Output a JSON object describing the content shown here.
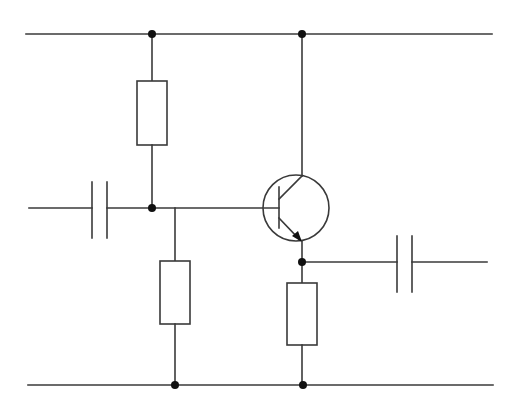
{
  "diagram": {
    "type": "circuit-schematic",
    "circuit": "NPN emitter-follower amplifier with voltage-divider bias",
    "components": [
      {
        "id": "R1",
        "kind": "resistor",
        "role": "upper bias resistor (top rail to base)"
      },
      {
        "id": "R2",
        "kind": "resistor",
        "role": "lower bias resistor (base to bottom rail)"
      },
      {
        "id": "R3",
        "kind": "resistor",
        "role": "emitter resistor"
      },
      {
        "id": "C1",
        "kind": "capacitor",
        "role": "input coupling capacitor"
      },
      {
        "id": "C2",
        "kind": "capacitor",
        "role": "output coupling capacitor"
      },
      {
        "id": "Q1",
        "kind": "npn-transistor",
        "role": "amplifying transistor"
      }
    ],
    "nodes": [
      "top-rail",
      "bottom-rail",
      "base-node",
      "emitter-output-node"
    ],
    "colors": {
      "line": "#3a3a3a",
      "junction": "#111111",
      "background": "#ffffff"
    }
  }
}
